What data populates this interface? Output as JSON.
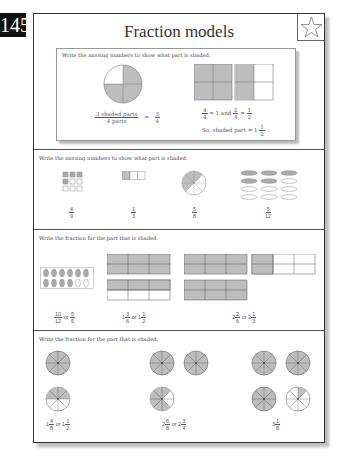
{
  "page_number": "145",
  "title": "Fraction models",
  "example": {
    "instruction": "Write the missing numbers to show what part is shaded.",
    "left_num": "3 shaded parts",
    "left_den": "4 parts",
    "eq": "=",
    "left_result_num": "3",
    "left_result_den": "4",
    "right_line1": {
      "a_num": "4",
      "a_den": "4",
      "eq1": "= 1  and",
      "b_num": "2",
      "b_den": "4",
      "eq2": "=",
      "c_num": "1",
      "c_den": "2"
    },
    "right_line2": "So, shaded part = 1",
    "right_line2_num": "1",
    "right_line2_den": "2"
  },
  "section2": {
    "instruction": "Write the missing numbers to show what part is shaded.",
    "answers": [
      {
        "num": "4",
        "den": "9"
      },
      {
        "num": "1",
        "den": "3"
      },
      {
        "num": "5",
        "den": "8"
      },
      {
        "num": "5",
        "den": "12"
      }
    ]
  },
  "section3": {
    "instruction": "Write the fraction for the part that is shaded.",
    "answers": [
      {
        "a_num": "10",
        "a_den": "12",
        "or": "or",
        "b_num": "5",
        "b_den": "6"
      },
      {
        "w1": "1",
        "a_num": "3",
        "a_den": "6",
        "or": "or",
        "w2": "1",
        "b_num": "1",
        "b_den": "2"
      },
      {
        "w1": "2",
        "a_num": "2",
        "a_den": "6",
        "or": "or",
        "w2": "2",
        "b_num": "1",
        "b_den": "3"
      }
    ]
  },
  "section4": {
    "instruction": "Write the fraction for the part that is shaded.",
    "answers": [
      {
        "w1": "1",
        "a_num": "4",
        "a_den": "8",
        "or": "or",
        "w2": "1",
        "b_num": "1",
        "b_den": "2"
      },
      {
        "w1": "2",
        "a_num": "6",
        "a_den": "8",
        "or": "or",
        "w2": "2",
        "b_num": "3",
        "b_den": "4"
      },
      {
        "w1": "3",
        "a_num": "1",
        "a_den": "8"
      }
    ]
  },
  "colors": {
    "shade": "#bdbdbd",
    "border": "#333333"
  }
}
